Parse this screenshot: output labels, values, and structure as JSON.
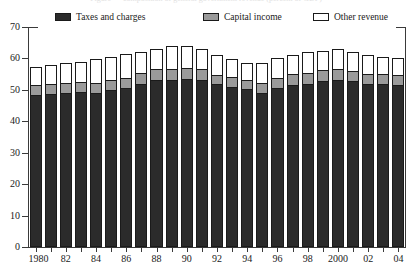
{
  "title_sliver": "Figure — composition of general government revenue (percent of GDP)",
  "legend": {
    "position": "top",
    "items": [
      {
        "label": "Taxes and charges",
        "color": "#2b2b2b",
        "swatch": "sw-dark",
        "icon": "legend-swatch-icon"
      },
      {
        "label": "Capital income",
        "color": "#9a9a9a",
        "swatch": "sw-mid",
        "icon": "legend-swatch-icon"
      },
      {
        "label": "Other revenue",
        "color": "#ffffff",
        "swatch": "sw-light",
        "icon": "legend-swatch-icon"
      }
    ]
  },
  "axes": {
    "y_ticks": [
      0,
      10,
      20,
      30,
      40,
      50,
      60,
      70
    ],
    "y_tick_labels": [
      "0",
      "10",
      "20",
      "30",
      "40",
      "50",
      "60",
      "70"
    ],
    "ylim": [
      0,
      70
    ],
    "x_tick_labels": [
      "1980",
      "82",
      "84",
      "86",
      "88",
      "90",
      "92",
      "94",
      "96",
      "98",
      "2000",
      "02",
      "04"
    ],
    "x_label_years": [
      1980,
      1982,
      1984,
      1986,
      1988,
      1990,
      1992,
      1994,
      1996,
      1998,
      2000,
      2002,
      2004
    ],
    "grid": false
  },
  "chart_data": {
    "type": "bar",
    "stacked": true,
    "title": "",
    "subtitle": "",
    "xlabel": "",
    "ylabel": "",
    "ylim": [
      0,
      70
    ],
    "grid": false,
    "legend_position": "top",
    "categories": [
      "1980",
      "1981",
      "1982",
      "1983",
      "1984",
      "1985",
      "1986",
      "1987",
      "1988",
      "1989",
      "1990",
      "1991",
      "1992",
      "1993",
      "1994",
      "1995",
      "1996",
      "1997",
      "1998",
      "1999",
      "2000",
      "2001",
      "2002",
      "2003",
      "2004"
    ],
    "series": [
      {
        "name": "Taxes and charges",
        "color": "#2b2b2b",
        "values": [
          48.5,
          48.8,
          49.0,
          49.3,
          49.0,
          50.0,
          50.5,
          52.0,
          53.0,
          53.0,
          53.5,
          53.3,
          51.8,
          51.0,
          50.2,
          49.0,
          50.5,
          51.5,
          52.0,
          52.8,
          53.2,
          52.8,
          52.0,
          51.8,
          51.5
        ]
      },
      {
        "name": "Capital income",
        "color": "#9a9a9a",
        "values": [
          3.0,
          3.2,
          3.2,
          3.2,
          3.3,
          3.2,
          3.2,
          3.3,
          3.5,
          3.6,
          3.6,
          3.2,
          3.0,
          3.0,
          3.0,
          3.2,
          3.3,
          3.4,
          3.5,
          3.5,
          3.6,
          3.3,
          3.2,
          3.2,
          3.2
        ]
      },
      {
        "name": "Other revenue",
        "color": "#ffffff",
        "values": [
          5.8,
          6.0,
          6.5,
          6.5,
          7.5,
          7.3,
          7.6,
          6.7,
          6.5,
          7.4,
          6.9,
          6.5,
          6.2,
          5.8,
          5.3,
          6.3,
          6.2,
          6.1,
          6.5,
          6.2,
          6.2,
          5.9,
          5.8,
          5.5,
          5.3
        ]
      }
    ],
    "totals": [
      57.3,
      58.0,
      58.7,
      59.0,
      59.8,
      60.5,
      61.3,
      62.0,
      63.0,
      64.0,
      64.0,
      63.0,
      61.0,
      59.8,
      58.5,
      58.5,
      60.0,
      61.0,
      62.0,
      62.5,
      63.0,
      62.0,
      61.0,
      60.5,
      60.0
    ]
  }
}
